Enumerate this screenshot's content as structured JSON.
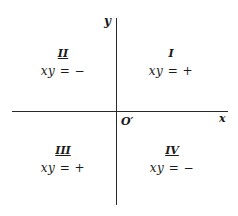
{
  "diagram": {
    "title": "",
    "axes": {
      "x_label": "x",
      "y_label": "y",
      "origin_label": "O′"
    },
    "quadrants": [
      {
        "id": "II",
        "numeral": "II",
        "equation": "xy = −",
        "sign": "negative",
        "position": "top-left"
      },
      {
        "id": "I",
        "numeral": "I",
        "equation": "xy = +",
        "sign": "positive",
        "position": "top-right"
      },
      {
        "id": "III",
        "numeral": "III",
        "equation": "xy = +",
        "sign": "positive",
        "position": "bottom-left"
      },
      {
        "id": "IV",
        "numeral": "IV",
        "equation": "xy = −",
        "sign": "negative",
        "position": "bottom-right"
      }
    ],
    "colors": {
      "line": "#2a2a2a",
      "text": "#1a1a1a",
      "background": "#ffffff"
    }
  }
}
